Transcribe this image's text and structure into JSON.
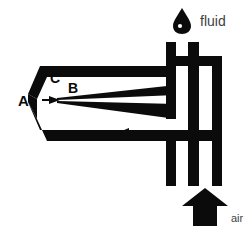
{
  "figure": {
    "background_color": "#ffffff",
    "ink_color": "#0b0b0b",
    "caption_color": "#3f3f3f",
    "width": 252,
    "height": 232
  },
  "labels": {
    "a": "A",
    "b": "B",
    "c": "C"
  },
  "annotations": {
    "fluid": {
      "text": "fluid",
      "icon": "droplet-icon"
    },
    "air": {
      "text": "air",
      "icon": "up-arrow-icon"
    }
  },
  "flow_arrows": [
    {
      "name": "upper-gas-flow-arrow",
      "direction": "left"
    },
    {
      "name": "lower-gas-flow-arrow",
      "direction": "left"
    },
    {
      "name": "nozzle-tip-spray-arrow",
      "direction": "right"
    }
  ]
}
